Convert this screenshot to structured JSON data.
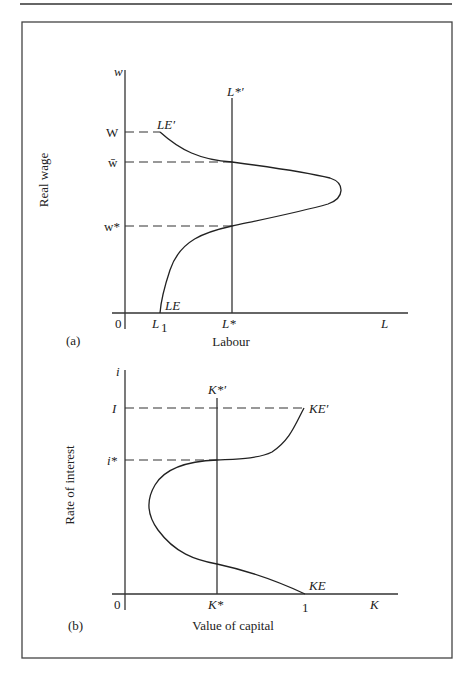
{
  "figure": {
    "top_rule": true,
    "panel_a": {
      "panel_label": "(a)",
      "y_axis_symbol": "w",
      "y_axis_title": "Real wage",
      "x_axis_title": "Labour",
      "x_axis_symbol": "L",
      "origin_label": "0",
      "y_ticks": {
        "W": "W",
        "w_bar": "w̄",
        "w_star": "w*"
      },
      "x_ticks": {
        "L1": "L",
        "L1_sub": "1",
        "L_star": "L*"
      },
      "vertical_line_label": "L*′",
      "curve_labels": {
        "upper": "LE′",
        "lower": "LE"
      }
    },
    "panel_b": {
      "panel_label": "(b)",
      "y_axis_symbol": "i",
      "y_axis_title": "Rate of interest",
      "x_axis_title": "Value of capital",
      "x_axis_symbol": "K",
      "origin_label": "0",
      "y_ticks": {
        "I": "I",
        "i_star": "i*"
      },
      "x_ticks": {
        "K_star": "K*",
        "one": "1"
      },
      "vertical_line_label": "K*′",
      "curve_labels": {
        "upper": "KE′",
        "lower": "KE"
      }
    }
  }
}
